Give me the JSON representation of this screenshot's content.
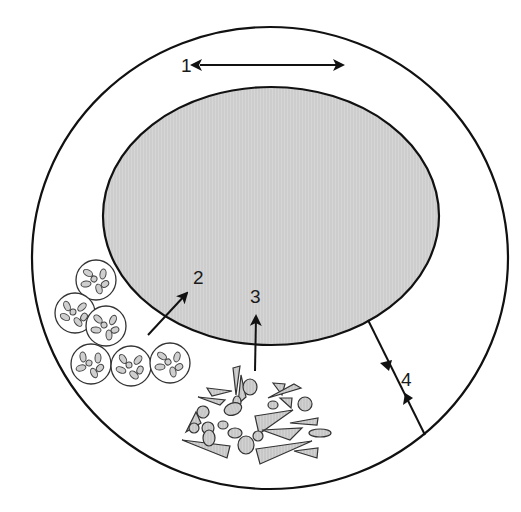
{
  "diagram": {
    "colors": {
      "stroke": "#111111",
      "inner_fill": "#d9d9d9",
      "particle_fill": "#cfcfcf",
      "background": "#ffffff"
    },
    "labels": {
      "route1": "1",
      "route2": "2",
      "route3": "3",
      "route4": "4"
    },
    "routes": [
      {
        "id": "1",
        "kind": "bidirectional-arrow",
        "meaning": "lateral exchange above inner body"
      },
      {
        "id": "2",
        "kind": "arrow",
        "meaning": "vesicle cluster entering inner body"
      },
      {
        "id": "3",
        "kind": "arrow",
        "meaning": "debris/particles entering inner body"
      },
      {
        "id": "4",
        "kind": "two-way-line",
        "meaning": "exchange between inner body and outer boundary"
      }
    ],
    "vesicle_count": 6,
    "debris_description": "mixed irregular triangles and ovals"
  }
}
